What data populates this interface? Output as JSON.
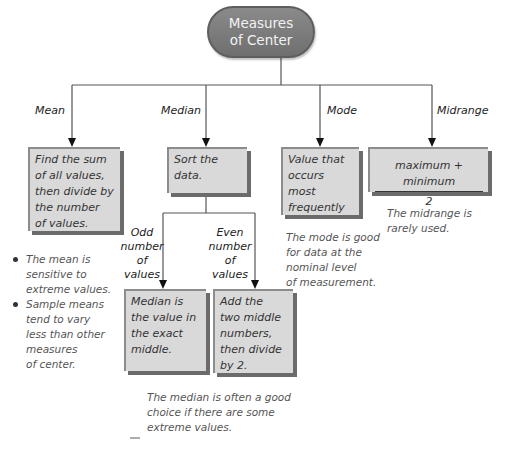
{
  "root": {
    "line1": "Measures",
    "line2": "of Center"
  },
  "branches": {
    "mean": {
      "label": "Mean",
      "box": [
        "Find the sum",
        "of all values,",
        "then divide by",
        "the number",
        "of values."
      ]
    },
    "median": {
      "label": "Median",
      "box": [
        "Sort the",
        "data."
      ],
      "odd": {
        "label": [
          "Odd",
          "number",
          "of",
          "values"
        ],
        "box": [
          "Median is",
          "the value in",
          "the exact",
          "middle."
        ]
      },
      "even": {
        "label": [
          "Even",
          "number",
          "of",
          "values"
        ],
        "box": [
          "Add the",
          "two middle",
          "numbers,",
          "then divide",
          "by 2."
        ]
      },
      "note": [
        "The median is often a good",
        "choice if there are some",
        "extreme values."
      ]
    },
    "mode": {
      "label": "Mode",
      "box": [
        "Value that",
        "occurs",
        "most",
        "frequently"
      ],
      "note": [
        "The mode is good",
        "for data at the",
        "nominal level",
        "of measurement."
      ]
    },
    "midrange": {
      "label": "Midrange",
      "numerator": "maximum + minimum",
      "denominator": "2",
      "note": [
        "The midrange is",
        "rarely used."
      ]
    }
  },
  "mean_notes": [
    [
      "The mean is",
      "sensitive to",
      "extreme values."
    ],
    [
      "Sample means",
      "tend to vary",
      "less than other",
      "measures",
      "of center."
    ]
  ],
  "colors": {
    "box_fill": "#d9d9d9",
    "box_shadow": "#6b6b6b",
    "root_fill": "#7a7a7a",
    "line": "#555555"
  }
}
